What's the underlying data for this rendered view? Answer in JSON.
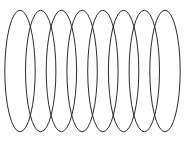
{
  "figure": {
    "background_color": "#fefefe",
    "page_background_color": "#ffffff",
    "canvas": {
      "width": 185,
      "height": 143
    }
  },
  "chart_data": {
    "type": "scatter",
    "subtitle": "",
    "xlabel": "",
    "ylabel": "",
    "xlim": [
      0,
      185
    ],
    "ylim": [
      0,
      143
    ],
    "grid": false,
    "legend": null,
    "shape_type": "ellipse",
    "shape_count": 8,
    "stroke_color": "#2c2c2c",
    "stroke_width": 1,
    "fill": "none",
    "ellipse_rx": 15.2,
    "ellipse_ry": 60.8,
    "center_y": 71,
    "center_spacing_x": 20.7,
    "top_apex_y": 10.2,
    "bottom_apex_y": 131.8,
    "left_extent_x": 4.8,
    "right_extent_x": 180.2,
    "shapes": [
      {
        "index": 1,
        "cx": 20.0,
        "cy": 71.0,
        "rx": 15.2,
        "ry": 60.8
      },
      {
        "index": 2,
        "cx": 40.7,
        "cy": 71.0,
        "rx": 15.2,
        "ry": 60.8
      },
      {
        "index": 3,
        "cx": 61.4,
        "cy": 71.0,
        "rx": 15.2,
        "ry": 60.8
      },
      {
        "index": 4,
        "cx": 82.1,
        "cy": 71.0,
        "rx": 15.2,
        "ry": 60.8
      },
      {
        "index": 5,
        "cx": 102.9,
        "cy": 71.0,
        "rx": 15.2,
        "ry": 60.8
      },
      {
        "index": 6,
        "cx": 123.6,
        "cy": 71.0,
        "rx": 15.2,
        "ry": 60.8
      },
      {
        "index": 7,
        "cx": 144.3,
        "cy": 71.0,
        "rx": 15.2,
        "ry": 60.8
      },
      {
        "index": 8,
        "cx": 165.0,
        "cy": 71.0,
        "rx": 15.2,
        "ry": 60.8
      }
    ]
  }
}
